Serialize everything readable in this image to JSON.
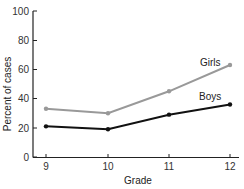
{
  "chart_data": {
    "type": "line",
    "title": "",
    "xlabel": "Grade",
    "ylabel": "Percent of cases",
    "x": [
      9,
      10,
      11,
      12
    ],
    "categories": [
      "9",
      "10",
      "11",
      "12"
    ],
    "ylim": [
      0,
      100
    ],
    "yticks": [
      "0",
      "20",
      "40",
      "60",
      "80",
      "100"
    ],
    "grid": false,
    "legend": "inline labels",
    "series": [
      {
        "name": "Girls",
        "values": [
          33,
          30,
          45,
          63
        ],
        "color": "#999999"
      },
      {
        "name": "Boys",
        "values": [
          21,
          19,
          29,
          36
        ],
        "color": "#111111"
      }
    ]
  }
}
